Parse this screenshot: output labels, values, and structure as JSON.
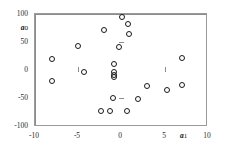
{
  "chart_data": {
    "type": "scatter",
    "title": "",
    "xlabel": "a 1",
    "ylabel": "a 0",
    "xlabel_symbol": "a",
    "xlabel_subscript": "1",
    "ylabel_symbol": "a",
    "ylabel_subscript": "0",
    "xlim": [
      -10,
      10
    ],
    "ylim": [
      -100,
      100
    ],
    "xticks": [
      -10,
      -5,
      0,
      5,
      10
    ],
    "yticks": [
      -100,
      -50,
      0,
      50,
      100
    ],
    "xtick_labels": [
      "-10",
      "-5",
      "0",
      "5",
      "10"
    ],
    "ytick_labels": [
      "-100",
      "-50",
      "0",
      "50",
      "100"
    ],
    "grid": false,
    "legend": false,
    "marker": "open-circle",
    "marker_color": "#1a1a1a",
    "frame_color": "#9a9a9a",
    "axis_color": "#8c8c8c",
    "points": [
      {
        "x": 0.0,
        "y": 95
      },
      {
        "x": 0.7,
        "y": 82
      },
      {
        "x": -2.0,
        "y": 72
      },
      {
        "x": 0.9,
        "y": 65
      },
      {
        "x": -5.0,
        "y": 43
      },
      {
        "x": -0.3,
        "y": 41
      },
      {
        "x": 7.0,
        "y": 23
      },
      {
        "x": -8.0,
        "y": 20
      },
      {
        "x": -0.9,
        "y": 12
      },
      {
        "x": -0.9,
        "y": -3
      },
      {
        "x": -4.3,
        "y": -3
      },
      {
        "x": -0.9,
        "y": -8
      },
      {
        "x": -0.9,
        "y": -12
      },
      {
        "x": -8.0,
        "y": -19
      },
      {
        "x": 7.0,
        "y": -25
      },
      {
        "x": 3.0,
        "y": -27
      },
      {
        "x": 5.3,
        "y": -35
      },
      {
        "x": -1.0,
        "y": -48
      },
      {
        "x": 1.9,
        "y": -51
      },
      {
        "x": 0.6,
        "y": -71
      },
      {
        "x": -2.4,
        "y": -72
      },
      {
        "x": -1.3,
        "y": -72
      }
    ]
  }
}
